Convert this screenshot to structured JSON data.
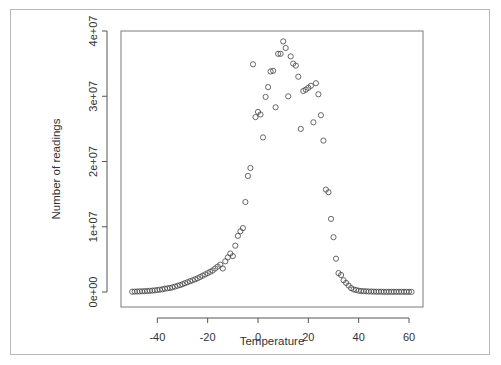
{
  "chart_data": {
    "type": "scatter",
    "title": "",
    "xlabel": "Temperature",
    "ylabel": "Number of readings",
    "xlim": [
      -52,
      63
    ],
    "ylim": [
      0,
      40000000
    ],
    "x_ticks": [
      -40,
      -20,
      0,
      20,
      40,
      60
    ],
    "x_tick_labels": [
      "-40",
      "-20",
      "0",
      "20",
      "40",
      "60"
    ],
    "y_ticks": [
      0,
      10000000,
      20000000,
      30000000,
      40000000
    ],
    "y_tick_labels": [
      "0e+00",
      "1e+07",
      "2e+07",
      "3e+07",
      "4e+07"
    ],
    "grid": false,
    "legend": null,
    "marker": "open-circle",
    "series": [
      {
        "name": "readings",
        "x": [
          -50,
          -49,
          -48,
          -47,
          -46,
          -45,
          -44,
          -43,
          -42,
          -41,
          -40,
          -39,
          -38,
          -37,
          -36,
          -35,
          -34,
          -33,
          -32,
          -31,
          -30,
          -29,
          -28,
          -27,
          -26,
          -25,
          -24,
          -23,
          -22,
          -21,
          -20,
          -19,
          -18,
          -17,
          -16,
          -15,
          -14,
          -13,
          -12,
          -11,
          -10,
          -9,
          -8,
          -7,
          -6,
          -5,
          -4,
          -3,
          -2,
          -1,
          0,
          1,
          2,
          3,
          4,
          5,
          6,
          7,
          8,
          9,
          10,
          11,
          12,
          13,
          14,
          15,
          16,
          17,
          18,
          19,
          20,
          21,
          22,
          23,
          24,
          25,
          26,
          27,
          28,
          29,
          30,
          31,
          32,
          33,
          34,
          35,
          36,
          37,
          38,
          39,
          40,
          41,
          42,
          43,
          44,
          45,
          46,
          47,
          48,
          49,
          50,
          51,
          52,
          53,
          54,
          55,
          56,
          57,
          58,
          59,
          60,
          61
        ],
        "y": [
          50000,
          60000,
          70000,
          90000,
          100000,
          120000,
          150000,
          180000,
          210000,
          250000,
          300000,
          350000,
          420000,
          500000,
          560000,
          620000,
          700000,
          820000,
          950000,
          1050000,
          1200000,
          1350000,
          1500000,
          1650000,
          1800000,
          1950000,
          2100000,
          2300000,
          2500000,
          2700000,
          2900000,
          3100000,
          3300000,
          3600000,
          3900000,
          4200000,
          3600000,
          4700000,
          5300000,
          5900000,
          5500000,
          7100000,
          8600000,
          9300000,
          9800000,
          13800000,
          17800000,
          19000000,
          34900000,
          26800000,
          27600000,
          27200000,
          23700000,
          29900000,
          31400000,
          33800000,
          33900000,
          28300000,
          36500000,
          36500000,
          38400000,
          37400000,
          30000000,
          36100000,
          35000000,
          34700000,
          33000000,
          25000000,
          30800000,
          31000000,
          31300000,
          31600000,
          26000000,
          32000000,
          30300000,
          27100000,
          23200000,
          15700000,
          15300000,
          11200000,
          8400000,
          5100000,
          2900000,
          2600000,
          1800000,
          1400000,
          1000000,
          600000,
          400000,
          300000,
          200000,
          150000,
          120000,
          100000,
          80000,
          70000,
          60000,
          50000,
          45000,
          40000,
          38000,
          36000,
          34000,
          32000,
          30000,
          28000,
          27000,
          26000,
          25000,
          24000,
          23000,
          22000
        ]
      }
    ]
  }
}
